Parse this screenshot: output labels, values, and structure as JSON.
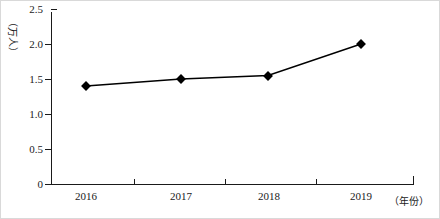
{
  "chart_data": {
    "type": "line",
    "title": "",
    "subtitle": "",
    "xlabel": "（年份）",
    "ylabel": "（万人）",
    "categories": [
      "2016",
      "2017",
      "2018",
      "2019"
    ],
    "values": [
      1.4,
      1.5,
      1.55,
      2.0
    ],
    "series": [
      {
        "name": "人数",
        "values": [
          1.4,
          1.5,
          1.55,
          2.0
        ]
      }
    ],
    "ylim": [
      0,
      2.5
    ],
    "yticks": [
      "0",
      "0.5",
      "1.0",
      "1.5",
      "2.0",
      "2.5"
    ],
    "ytick_values": [
      0,
      0.5,
      1.0,
      1.5,
      2.0,
      2.5
    ],
    "xticks": [
      "2016",
      "2017",
      "2018",
      "2019"
    ],
    "grid": false,
    "legend": "none",
    "marker": "diamond",
    "line_color": "#000000",
    "marker_color": "#000000",
    "axis_color": "#1a1a1a",
    "background": "#ffffff"
  }
}
